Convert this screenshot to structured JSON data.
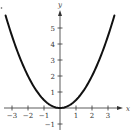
{
  "chart_data": {
    "type": "line",
    "title": "",
    "xlabel": "x",
    "ylabel": "y",
    "xlim": [
      -3.5,
      3.6
    ],
    "ylim": [
      -1.4,
      6
    ],
    "grid": false,
    "legend": null,
    "x_ticks": [
      -3,
      -2,
      -1,
      1,
      2,
      3
    ],
    "x_tick_labels": [
      "−3",
      "−2",
      "−1",
      "1",
      "2",
      "3"
    ],
    "y_ticks": [
      -1,
      1,
      2,
      3,
      4,
      5
    ],
    "y_tick_labels": [
      "−1",
      "1",
      "2",
      "3",
      "4",
      "5"
    ],
    "series": [
      {
        "name": "y = x²/2",
        "equation": "y = 0.5x^2",
        "color": "#111111",
        "x": [
          -3.4,
          -3,
          -2.5,
          -2,
          -1.5,
          -1,
          -0.5,
          0,
          0.5,
          1,
          1.5,
          2,
          2.5,
          3,
          3.4
        ],
        "values": [
          5.78,
          4.5,
          3.125,
          2,
          1.125,
          0.5,
          0.125,
          0,
          0.125,
          0.5,
          1.125,
          2,
          3.125,
          4.5,
          5.78
        ]
      }
    ]
  },
  "labels": {
    "x_axis": "x",
    "y_axis": "y"
  }
}
